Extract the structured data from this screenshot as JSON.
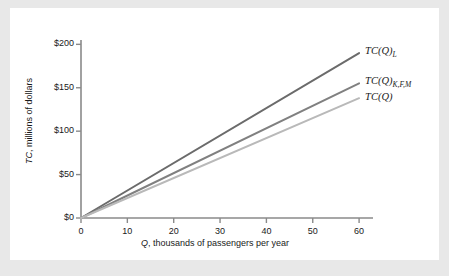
{
  "figure": {
    "background_color": "#ffffff",
    "page_background_color": "#e8e8e8"
  },
  "chart_data": {
    "type": "line",
    "title": "",
    "xlabel_prefix": "Q",
    "xlabel_rest": ", thousands of passengers per year",
    "ylabel_prefix": "TC",
    "ylabel_rest": ", millions of dollars",
    "x": [
      0,
      60
    ],
    "xlim": [
      0,
      63
    ],
    "ylim": [
      0,
      205
    ],
    "xticks": [
      0,
      10,
      20,
      30,
      40,
      50,
      60
    ],
    "xtick_labels": [
      "0",
      "10",
      "20",
      "30",
      "40",
      "50",
      "60"
    ],
    "yticks": [
      0,
      50,
      100,
      150,
      200
    ],
    "ytick_labels": [
      "$0",
      "$50",
      "$100",
      "$150",
      "$200"
    ],
    "grid": false,
    "legend_position": "right-inline",
    "series": [
      {
        "name": "TC(Q)_L",
        "label_main": "TC(Q)",
        "label_sub": "L",
        "color": "#6b6b6b",
        "width": 2.0,
        "values": [
          0,
          190
        ]
      },
      {
        "name": "TC(Q)_KFM",
        "label_main": "TC(Q)",
        "label_sub": "K,F,M",
        "color": "#808080",
        "width": 2.0,
        "values": [
          0,
          155
        ]
      },
      {
        "name": "TC(Q)",
        "label_main": "TC(Q)",
        "label_sub": "",
        "color": "#b9b9b9",
        "width": 2.0,
        "values": [
          0,
          138
        ]
      }
    ],
    "axis_color": "#8a8a8a"
  }
}
